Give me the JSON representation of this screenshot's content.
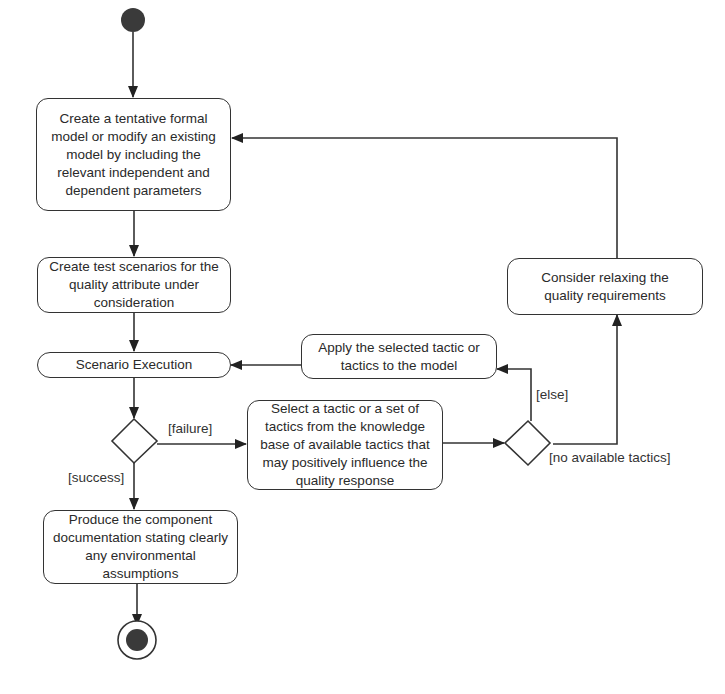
{
  "diagram": {
    "type": "UML activity diagram",
    "nodes": {
      "start": {
        "kind": "initial"
      },
      "create_model": {
        "label": "Create a tentative formal model or modify an existing model by including the relevant independent and dependent parameters"
      },
      "create_scenarios": {
        "label": "Create test scenarios for the quality attribute under consideration"
      },
      "scenario_execution": {
        "label": "Scenario Execution"
      },
      "decision_result": {
        "kind": "decision"
      },
      "select_tactic": {
        "label": "Select a tactic or a set of tactics from the knowledge base of available tactics that may positively influence the quality response"
      },
      "decision_tactics": {
        "kind": "decision"
      },
      "apply_tactic": {
        "label": "Apply the selected tactic or tactics to the model"
      },
      "relax_requirements": {
        "label": "Consider relaxing the quality requirements"
      },
      "produce_docs": {
        "label": "Produce the component documentation stating clearly any environmental assumptions"
      },
      "end": {
        "kind": "final"
      }
    },
    "guards": {
      "failure": "[failure]",
      "success": "[success]",
      "else": "[else]",
      "no_tactics": "[no available tactics]"
    },
    "edges": [
      {
        "from": "start",
        "to": "create_model"
      },
      {
        "from": "create_model",
        "to": "create_scenarios"
      },
      {
        "from": "create_scenarios",
        "to": "scenario_execution"
      },
      {
        "from": "scenario_execution",
        "to": "decision_result"
      },
      {
        "from": "decision_result",
        "to": "select_tactic",
        "guard": "[failure]"
      },
      {
        "from": "decision_result",
        "to": "produce_docs",
        "guard": "[success]"
      },
      {
        "from": "select_tactic",
        "to": "decision_tactics"
      },
      {
        "from": "decision_tactics",
        "to": "apply_tactic",
        "guard": "[else]"
      },
      {
        "from": "decision_tactics",
        "to": "relax_requirements",
        "guard": "[no available tactics]"
      },
      {
        "from": "apply_tactic",
        "to": "scenario_execution"
      },
      {
        "from": "relax_requirements",
        "to": "create_model"
      },
      {
        "from": "produce_docs",
        "to": "end"
      }
    ],
    "colors": {
      "stroke": "#333333",
      "fill": "#ffffff",
      "text": "#2a2a2a",
      "node_dot": "#3a3a3a"
    }
  }
}
